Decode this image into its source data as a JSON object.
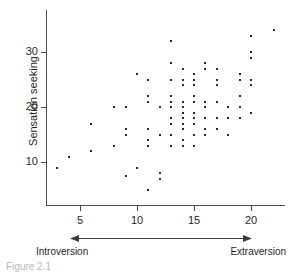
{
  "figure": {
    "caption": "Figure 2.1",
    "background_color": "#ffffff",
    "axis_color": "#4a4a4a",
    "point_color": "#2b2b2b"
  },
  "annotation": {
    "left_label": "Introversion",
    "right_label": "Extraversion",
    "arrow_name": "double-headed-arrow"
  },
  "axes": {
    "y_title": "Sensation seeking",
    "y_ticks": [
      "10",
      "20",
      "30"
    ],
    "x_ticks": [
      "5",
      "10",
      "15",
      "20"
    ]
  },
  "chart_data": {
    "type": "scatter",
    "title": "",
    "subtitle": "",
    "xlabel": "",
    "ylabel": "Sensation seeking",
    "x_annotation_left": "Introversion",
    "x_annotation_right": "Extraversion",
    "xlim": [
      2,
      23
    ],
    "ylim": [
      3,
      36
    ],
    "xticks": [
      5,
      10,
      15,
      20
    ],
    "yticks": [
      10,
      20,
      30
    ],
    "grid": false,
    "legend": null,
    "marker": "small-square-dot",
    "n_points": 88,
    "series": [
      {
        "name": "Participants",
        "points": [
          [
            3,
            9
          ],
          [
            4,
            11
          ],
          [
            6,
            17
          ],
          [
            6,
            12
          ],
          [
            8,
            20
          ],
          [
            8,
            13
          ],
          [
            9,
            20
          ],
          [
            9,
            16
          ],
          [
            9,
            15
          ],
          [
            9,
            7.5
          ],
          [
            10,
            26
          ],
          [
            10,
            9
          ],
          [
            11,
            25
          ],
          [
            11,
            22
          ],
          [
            11,
            21
          ],
          [
            11,
            16
          ],
          [
            11,
            14
          ],
          [
            11,
            13
          ],
          [
            11,
            5
          ],
          [
            12,
            20
          ],
          [
            12,
            15
          ],
          [
            12,
            8
          ],
          [
            12,
            7
          ],
          [
            13,
            32
          ],
          [
            13,
            28
          ],
          [
            13,
            25
          ],
          [
            13,
            22
          ],
          [
            13,
            21
          ],
          [
            13,
            20
          ],
          [
            13,
            18
          ],
          [
            13,
            17
          ],
          [
            13,
            15
          ],
          [
            13,
            13
          ],
          [
            14,
            27
          ],
          [
            14,
            25
          ],
          [
            14,
            24
          ],
          [
            14,
            21
          ],
          [
            14,
            20
          ],
          [
            14,
            19
          ],
          [
            14,
            18
          ],
          [
            14,
            17
          ],
          [
            14,
            16
          ],
          [
            14,
            14
          ],
          [
            14,
            13
          ],
          [
            15,
            26
          ],
          [
            15,
            25
          ],
          [
            15,
            24
          ],
          [
            15,
            22
          ],
          [
            15,
            21
          ],
          [
            15,
            19
          ],
          [
            15,
            18
          ],
          [
            15,
            17
          ],
          [
            15,
            15
          ],
          [
            15,
            13
          ],
          [
            16,
            28
          ],
          [
            16,
            27
          ],
          [
            16,
            21
          ],
          [
            16,
            20
          ],
          [
            16,
            18
          ],
          [
            16,
            16
          ],
          [
            16,
            15
          ],
          [
            17,
            27
          ],
          [
            17,
            25
          ],
          [
            17,
            24
          ],
          [
            17,
            21
          ],
          [
            17,
            18
          ],
          [
            17,
            16
          ],
          [
            18,
            20
          ],
          [
            18,
            18
          ],
          [
            18,
            15
          ],
          [
            19,
            26
          ],
          [
            19,
            25
          ],
          [
            19,
            22
          ],
          [
            19,
            20
          ],
          [
            19,
            18
          ],
          [
            20,
            33
          ],
          [
            20,
            30
          ],
          [
            20,
            29
          ],
          [
            20,
            25
          ],
          [
            20,
            24
          ],
          [
            20,
            19
          ],
          [
            22,
            34
          ]
        ]
      }
    ]
  }
}
